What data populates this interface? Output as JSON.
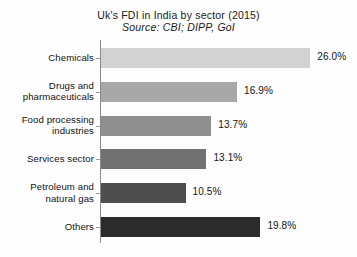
{
  "chart_data": {
    "type": "bar",
    "orientation": "horizontal",
    "title": "Uk's FDI in India by sector (2015)",
    "subtitle": "Source: CBI; DIPP, GoI",
    "xlabel": "",
    "ylabel": "",
    "xlim": [
      0,
      30
    ],
    "grid": false,
    "legend": "none",
    "categories": [
      "Chemicals",
      "Drugs and pharmaceuticals",
      "Food processing industries",
      "Services sector",
      "Petroleum and natural gas",
      "Others"
    ],
    "values": [
      26.0,
      16.9,
      13.7,
      13.1,
      10.5,
      19.8
    ],
    "value_labels": [
      "26.0%",
      "16.9%",
      "13.7%",
      "13.1%",
      "10.5%",
      "19.8%"
    ],
    "bar_colors": [
      "#d2d2d2",
      "#a8a8a8",
      "#8f8f8f",
      "#717171",
      "#4e4e4e",
      "#2b2b2b"
    ],
    "bars": [
      {
        "category_lines": [
          "Chemicals"
        ],
        "value": 26.0,
        "label": "26.0%",
        "color": "#d2d2d2"
      },
      {
        "category_lines": [
          "Drugs and",
          "pharmaceuticals"
        ],
        "value": 16.9,
        "label": "16.9%",
        "color": "#a8a8a8"
      },
      {
        "category_lines": [
          "Food processing",
          "industries"
        ],
        "value": 13.7,
        "label": "13.7%",
        "color": "#8f8f8f"
      },
      {
        "category_lines": [
          "Services sector"
        ],
        "value": 13.1,
        "label": "13.1%",
        "color": "#717171"
      },
      {
        "category_lines": [
          "Petroleum and",
          "natural gas"
        ],
        "value": 10.5,
        "label": "10.5%",
        "color": "#4e4e4e"
      },
      {
        "category_lines": [
          "Others"
        ],
        "value": 19.8,
        "label": "19.8%",
        "color": "#2b2b2b"
      }
    ]
  },
  "colors": {
    "background": "#fdfdfd",
    "text": "#141414",
    "axis": "#8a8a8a"
  }
}
